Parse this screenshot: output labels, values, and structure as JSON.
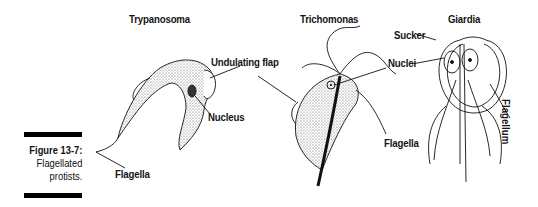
{
  "figure": {
    "number": "Figure 13-7:",
    "caption_lines": [
      "Flagellated",
      "protists."
    ]
  },
  "organisms": [
    {
      "name": "Trypanosoma",
      "labels": [
        "Undulating flap",
        "Nucleus",
        "Flagella"
      ]
    },
    {
      "name": "Trichomonas",
      "labels": [
        "Nuclei",
        "Flagella"
      ]
    },
    {
      "name": "Giardia",
      "labels": [
        "Sucker",
        "Flagellum"
      ]
    }
  ],
  "colors": {
    "ink": "#111111",
    "background": "#ffffff",
    "stipple": "#bdbdbd"
  }
}
